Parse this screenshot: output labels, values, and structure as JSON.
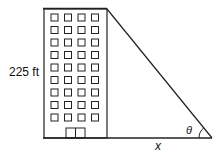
{
  "diagram": {
    "type": "right-triangle-word-problem",
    "height_label": "225 ft",
    "base_label": "x",
    "angle_label": "θ",
    "building": {
      "window_rows": 9,
      "window_cols": 4,
      "has_door": true
    }
  }
}
